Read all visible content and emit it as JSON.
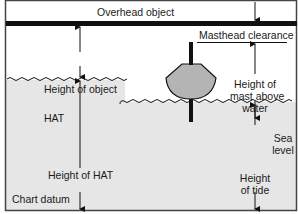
{
  "diagram": {
    "labels": {
      "overhead_object": "Overhead object",
      "masthead_clearance": "Masthead clearance",
      "height_of_object": "Height of object",
      "height_of_mast_line1": "Height of",
      "height_of_mast_line2": "mast above",
      "height_of_mast_line3": "water",
      "hat": "HAT",
      "sea_level_line1": "Sea",
      "sea_level_line2": "level",
      "height_of_hat": "Height of HAT",
      "chart_datum": "Chart datum",
      "height_of_tide_line1": "Height",
      "height_of_tide_line2": "of tide"
    },
    "colors": {
      "water": "#e6e6e6",
      "hull": "#b4b4b4",
      "line": "#111111",
      "frame": "#444444"
    }
  }
}
